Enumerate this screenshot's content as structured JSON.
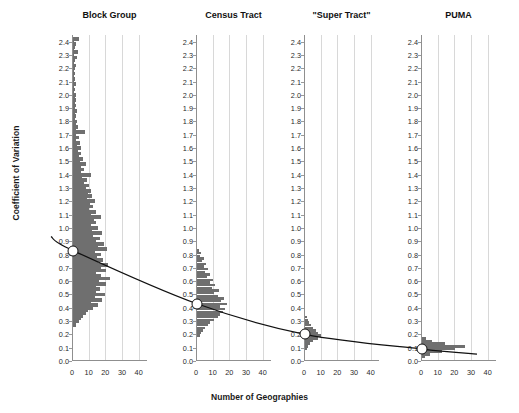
{
  "chart_data": {
    "type": "bar",
    "title": "",
    "xlabel": "Number of Geographies",
    "ylabel": "Coefficient of Variation",
    "xlim": [
      0,
      45
    ],
    "ylim": [
      0.0,
      2.45
    ],
    "xticks": [
      0,
      10,
      20,
      30,
      40
    ],
    "yticks": [
      "0.0",
      "0.1",
      "0.2",
      "0.3",
      "0.4",
      "0.5",
      "0.6",
      "0.7",
      "0.8",
      "0.9",
      "1.0",
      "1.1",
      "1.2",
      "1.3",
      "1.4",
      "1.5",
      "1.6",
      "1.7",
      "1.8",
      "1.9",
      "2.0",
      "2.1",
      "2.2",
      "2.3",
      "2.4"
    ],
    "grid": true,
    "legend": "none",
    "orientation": "horizontal-histogram",
    "bar_color": "#6f6f6f",
    "marker_color": "#ffffff",
    "line_color": "#111111",
    "panels": [
      {
        "label": "Block Group",
        "median_cv": 0.83,
        "bins": [
          {
            "cv": 0.27,
            "count": 2.0
          },
          {
            "cv": 0.3,
            "count": 3.5
          },
          {
            "cv": 0.32,
            "count": 4.5
          },
          {
            "cv": 0.34,
            "count": 6.0
          },
          {
            "cv": 0.36,
            "count": 7.5
          },
          {
            "cv": 0.38,
            "count": 9.0
          },
          {
            "cv": 0.4,
            "count": 12.0
          },
          {
            "cv": 0.42,
            "count": 15.0
          },
          {
            "cv": 0.44,
            "count": 11.0
          },
          {
            "cv": 0.46,
            "count": 17.5
          },
          {
            "cv": 0.48,
            "count": 13.0
          },
          {
            "cv": 0.5,
            "count": 19.0
          },
          {
            "cv": 0.52,
            "count": 14.0
          },
          {
            "cv": 0.54,
            "count": 16.0
          },
          {
            "cv": 0.56,
            "count": 13.5
          },
          {
            "cv": 0.58,
            "count": 20.0
          },
          {
            "cv": 0.6,
            "count": 15.5
          },
          {
            "cv": 0.62,
            "count": 22.0
          },
          {
            "cv": 0.64,
            "count": 17.0
          },
          {
            "cv": 0.66,
            "count": 14.0
          },
          {
            "cv": 0.68,
            "count": 19.5
          },
          {
            "cv": 0.7,
            "count": 16.5
          },
          {
            "cv": 0.72,
            "count": 21.0
          },
          {
            "cv": 0.74,
            "count": 15.0
          },
          {
            "cv": 0.76,
            "count": 18.0
          },
          {
            "cv": 0.78,
            "count": 14.5
          },
          {
            "cv": 0.8,
            "count": 17.0
          },
          {
            "cv": 0.82,
            "count": 13.0
          },
          {
            "cv": 0.84,
            "count": 20.5
          },
          {
            "cv": 0.86,
            "count": 15.0
          },
          {
            "cv": 0.88,
            "count": 18.5
          },
          {
            "cv": 0.9,
            "count": 13.5
          },
          {
            "cv": 0.92,
            "count": 16.0
          },
          {
            "cv": 0.94,
            "count": 12.0
          },
          {
            "cv": 0.96,
            "count": 17.5
          },
          {
            "cv": 0.98,
            "count": 11.5
          },
          {
            "cv": 1.0,
            "count": 15.0
          },
          {
            "cv": 1.02,
            "count": 10.5
          },
          {
            "cv": 1.04,
            "count": 14.0
          },
          {
            "cv": 1.06,
            "count": 12.5
          },
          {
            "cv": 1.08,
            "count": 16.5
          },
          {
            "cv": 1.1,
            "count": 11.0
          },
          {
            "cv": 1.12,
            "count": 13.5
          },
          {
            "cv": 1.14,
            "count": 9.5
          },
          {
            "cv": 1.16,
            "count": 12.0
          },
          {
            "cv": 1.18,
            "count": 10.0
          },
          {
            "cv": 1.2,
            "count": 13.0
          },
          {
            "cv": 1.22,
            "count": 8.5
          },
          {
            "cv": 1.24,
            "count": 11.5
          },
          {
            "cv": 1.26,
            "count": 9.0
          },
          {
            "cv": 1.28,
            "count": 10.5
          },
          {
            "cv": 1.3,
            "count": 7.5
          },
          {
            "cv": 1.32,
            "count": 9.5
          },
          {
            "cv": 1.34,
            "count": 6.5
          },
          {
            "cv": 1.36,
            "count": 8.5
          },
          {
            "cv": 1.38,
            "count": 5.5
          },
          {
            "cv": 1.4,
            "count": 11.0
          },
          {
            "cv": 1.42,
            "count": 5.0
          },
          {
            "cv": 1.44,
            "count": 6.5
          },
          {
            "cv": 1.46,
            "count": 4.5
          },
          {
            "cv": 1.48,
            "count": 7.5
          },
          {
            "cv": 1.5,
            "count": 4.0
          },
          {
            "cv": 1.52,
            "count": 6.0
          },
          {
            "cv": 1.54,
            "count": 3.5
          },
          {
            "cv": 1.56,
            "count": 5.0
          },
          {
            "cv": 1.58,
            "count": 3.0
          },
          {
            "cv": 1.6,
            "count": 4.5
          },
          {
            "cv": 1.62,
            "count": 2.5
          },
          {
            "cv": 1.64,
            "count": 4.0
          },
          {
            "cv": 1.66,
            "count": 2.0
          },
          {
            "cv": 1.68,
            "count": 3.5
          },
          {
            "cv": 1.7,
            "count": 2.0
          },
          {
            "cv": 1.72,
            "count": 7.0
          },
          {
            "cv": 1.74,
            "count": 1.5
          },
          {
            "cv": 1.76,
            "count": 3.0
          },
          {
            "cv": 1.78,
            "count": 1.5
          },
          {
            "cv": 1.8,
            "count": 2.5
          },
          {
            "cv": 1.82,
            "count": 1.2
          },
          {
            "cv": 1.84,
            "count": 2.0
          },
          {
            "cv": 1.86,
            "count": 1.0
          },
          {
            "cv": 1.88,
            "count": 2.5
          },
          {
            "cv": 1.9,
            "count": 1.0
          },
          {
            "cv": 1.92,
            "count": 1.8
          },
          {
            "cv": 1.94,
            "count": 0.9
          },
          {
            "cv": 1.96,
            "count": 1.5
          },
          {
            "cv": 1.98,
            "count": 0.9
          },
          {
            "cv": 2.0,
            "count": 2.0
          },
          {
            "cv": 2.02,
            "count": 0.8
          },
          {
            "cv": 2.04,
            "count": 1.2
          },
          {
            "cv": 2.06,
            "count": 0.8
          },
          {
            "cv": 2.08,
            "count": 1.5
          },
          {
            "cv": 2.1,
            "count": 0.8
          },
          {
            "cv": 2.12,
            "count": 1.0
          },
          {
            "cv": 2.14,
            "count": 0.7
          },
          {
            "cv": 2.16,
            "count": 1.2
          },
          {
            "cv": 2.18,
            "count": 0.7
          },
          {
            "cv": 2.2,
            "count": 0.9
          },
          {
            "cv": 2.22,
            "count": 1.5
          },
          {
            "cv": 2.24,
            "count": 0.7
          },
          {
            "cv": 2.26,
            "count": 1.0
          },
          {
            "cv": 2.28,
            "count": 2.5
          },
          {
            "cv": 2.3,
            "count": 0.8
          },
          {
            "cv": 2.32,
            "count": 3.0
          },
          {
            "cv": 2.34,
            "count": 0.7
          },
          {
            "cv": 2.36,
            "count": 1.0
          },
          {
            "cv": 2.38,
            "count": 2.0
          },
          {
            "cv": 2.4,
            "count": 0.8
          },
          {
            "cv": 2.42,
            "count": 3.5
          }
        ]
      },
      {
        "label": "Census Tract",
        "median_cv": 0.43,
        "bins": [
          {
            "cv": 0.19,
            "count": 1.5
          },
          {
            "cv": 0.21,
            "count": 2.5
          },
          {
            "cv": 0.23,
            "count": 3.5
          },
          {
            "cv": 0.25,
            "count": 5.0
          },
          {
            "cv": 0.27,
            "count": 6.5
          },
          {
            "cv": 0.29,
            "count": 8.0
          },
          {
            "cv": 0.31,
            "count": 10.0
          },
          {
            "cv": 0.33,
            "count": 12.5
          },
          {
            "cv": 0.35,
            "count": 14.0
          },
          {
            "cv": 0.37,
            "count": 15.5
          },
          {
            "cv": 0.39,
            "count": 17.0
          },
          {
            "cv": 0.41,
            "count": 13.5
          },
          {
            "cv": 0.43,
            "count": 18.0
          },
          {
            "cv": 0.45,
            "count": 14.5
          },
          {
            "cv": 0.47,
            "count": 16.0
          },
          {
            "cv": 0.49,
            "count": 12.5
          },
          {
            "cv": 0.51,
            "count": 10.0
          },
          {
            "cv": 0.53,
            "count": 13.0
          },
          {
            "cv": 0.55,
            "count": 9.0
          },
          {
            "cv": 0.57,
            "count": 11.0
          },
          {
            "cv": 0.59,
            "count": 7.5
          },
          {
            "cv": 0.61,
            "count": 9.5
          },
          {
            "cv": 0.63,
            "count": 6.0
          },
          {
            "cv": 0.65,
            "count": 8.0
          },
          {
            "cv": 0.67,
            "count": 5.0
          },
          {
            "cv": 0.69,
            "count": 6.5
          },
          {
            "cv": 0.71,
            "count": 4.0
          },
          {
            "cv": 0.73,
            "count": 5.5
          },
          {
            "cv": 0.75,
            "count": 3.0
          },
          {
            "cv": 0.77,
            "count": 4.0
          },
          {
            "cv": 0.79,
            "count": 2.0
          },
          {
            "cv": 0.81,
            "count": 2.5
          },
          {
            "cv": 0.83,
            "count": 1.2
          }
        ]
      },
      {
        "label": "\"Super Tract\"",
        "median_cv": 0.2,
        "bins": [
          {
            "cv": 0.09,
            "count": 1.0
          },
          {
            "cv": 0.11,
            "count": 1.5
          },
          {
            "cv": 0.13,
            "count": 3.0
          },
          {
            "cv": 0.15,
            "count": 5.0
          },
          {
            "cv": 0.17,
            "count": 7.5
          },
          {
            "cv": 0.19,
            "count": 9.5
          },
          {
            "cv": 0.21,
            "count": 8.0
          },
          {
            "cv": 0.23,
            "count": 6.5
          },
          {
            "cv": 0.25,
            "count": 5.0
          },
          {
            "cv": 0.27,
            "count": 3.5
          },
          {
            "cv": 0.29,
            "count": 2.5
          },
          {
            "cv": 0.31,
            "count": 1.5
          },
          {
            "cv": 0.33,
            "count": 1.0
          }
        ]
      },
      {
        "label": "PUMA",
        "median_cv": 0.09,
        "bins": [
          {
            "cv": 0.03,
            "count": 2.0
          },
          {
            "cv": 0.05,
            "count": 5.0
          },
          {
            "cv": 0.07,
            "count": 12.0
          },
          {
            "cv": 0.09,
            "count": 20.0
          },
          {
            "cv": 0.11,
            "count": 26.0
          },
          {
            "cv": 0.13,
            "count": 14.0
          },
          {
            "cv": 0.15,
            "count": 6.0
          },
          {
            "cv": 0.17,
            "count": 2.5
          }
        ]
      }
    ]
  }
}
